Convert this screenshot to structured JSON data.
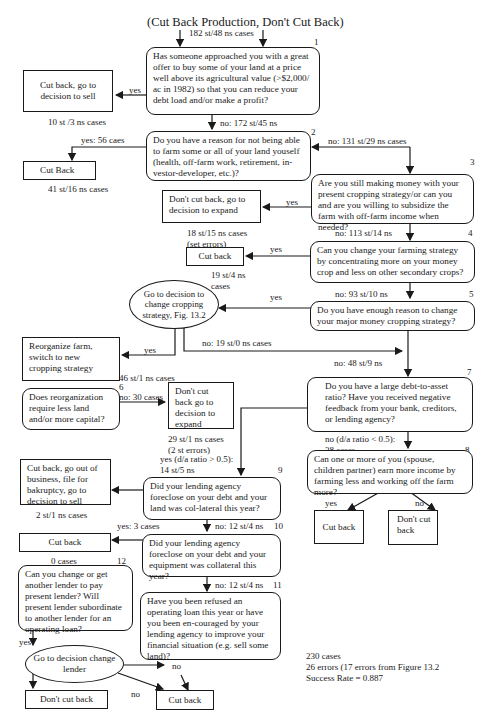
{
  "title": "(Cut Back Production, Don't Cut Back)",
  "entry_label": "182 st/48  ns cases",
  "nodes": {
    "q1": {
      "num": "1",
      "text": "Has someone approached you with a great offer to buy some of your land at a price well above its agricultural value (>$2,000/ ac in 1982) so that you can reduce your debt load and/or make a profit?"
    },
    "q2": {
      "num": "2",
      "text": "Do you have a reason for not being able to farm some or all of your land youself (health, off-farm work, retirement, in-vestor-developer, etc.)?"
    },
    "q3": {
      "num": "3",
      "text": "Are you still making money with your present cropping strategy/or can you and are you willing to subsidize the farm with off-farm income when needed?"
    },
    "q4": {
      "num": "4",
      "text": "Can you change your farming strategy by concentrating more on your money crop and less on other secondary crops?"
    },
    "q5": {
      "num": "5",
      "text": "Do you have enough reason to change your major money cropping strategy?"
    },
    "q6": {
      "num": "6",
      "text": "Does reorganization require less land and/or more capital?"
    },
    "q7": {
      "num": "7",
      "text": "Do you have a large debt-to-asset ratio?  Have you received negative feedback from your bank, creditors, or lending agency?"
    },
    "q8": {
      "num": "8",
      "text": "Can one or more of you (spouse, children partner) earn more income by farming less and working off the farm more?"
    },
    "q9": {
      "num": "9",
      "text": "Did your lending agency foreclose on your debt and your land was col-lateral this year?"
    },
    "q10": {
      "num": "10",
      "text": "Did your lending agency foreclose on your debt and your equipment was collateral this year?"
    },
    "q11": {
      "num": "11",
      "text": "Have you been refused an operating loan this year or have you been en-couraged by your lending agency to improve your financial situation (e.g. sell some land)?"
    },
    "q12": {
      "num": "12",
      "text": "Can you change or  get another lender to pay present lender? Will present lender subordinate to another lender for an operating loan?"
    }
  },
  "outcomes": {
    "o1": "Cut back, go to decision to sell",
    "o2": "Cut Back",
    "o3": "Don't cut back, go to decision to expand",
    "o4": "Cut back",
    "o5": "Go to decision to change cropping strategy, Fig. 13.2",
    "o6": "Reorganize farm, switch to new cropping strategy",
    "o7": "Don't cut back go to decision to expand",
    "o8a": "Cut back",
    "o8b": "Don't cut back",
    "o9": "Cut back, go out of business, file for bakruptcy, go to decision to sell",
    "o10": "Cut back",
    "o12": "Go to decision change lender",
    "o12a": "Don't cut back",
    "o12b": "Cut back"
  },
  "edge_labels": {
    "q1_yes": "yes",
    "o1_count": "10 st /3 ns cases",
    "q1_no": "no: 172 st/45 ns",
    "q2_yes": "yes: 56 caes",
    "o2_count": "41 st/16 ns cases",
    "q2_no": "no: 131 st/29 ns cases",
    "q3_yes": "yes",
    "o3_count": "18 st/15 ns cases",
    "o3_note": "(set errors)",
    "q3_no": "no: 113 st/14 ns",
    "q4_yes": "yes",
    "o4_count_1": "19 st/4 ns",
    "o4_count_2": "cases",
    "q4_no": "no: 93 st/10 ns",
    "q5_yes": "yes",
    "o5_yes": "yes",
    "o5_no": "no: 19 st/0 ns cases",
    "o6_count": "46 st/1 ns cases",
    "q5_no": "no: 48 st/9 ns",
    "q6_no": "no: 30 cases",
    "o7_count": "29 st/1 ns cases",
    "o7_note": "(2 st errors)",
    "q7_yes_1": "yes (d/a ratio > 0.5):",
    "q7_yes_2": "14 st/5 ns",
    "q7_no_1": "no (d/a ratio < 0.5):",
    "q7_no_2": "38  cases",
    "q8_yes": "yes",
    "q8_no": "no",
    "o9_count": "2 st/1 ns cases",
    "q9_yes": "yes: 3 cases",
    "q9_no": "no: 12 st/4 ns",
    "o10_count": "0 cases",
    "q10_no": "no: 12 st/4 ns",
    "q12_yes": "yes",
    "o12_no_1": "no",
    "o12_no_2": "no"
  },
  "summary": {
    "cases": "230 cases",
    "errors": "26 errors (17 errors from Figure 13.2",
    "success": "Success Rate = 0.887"
  }
}
